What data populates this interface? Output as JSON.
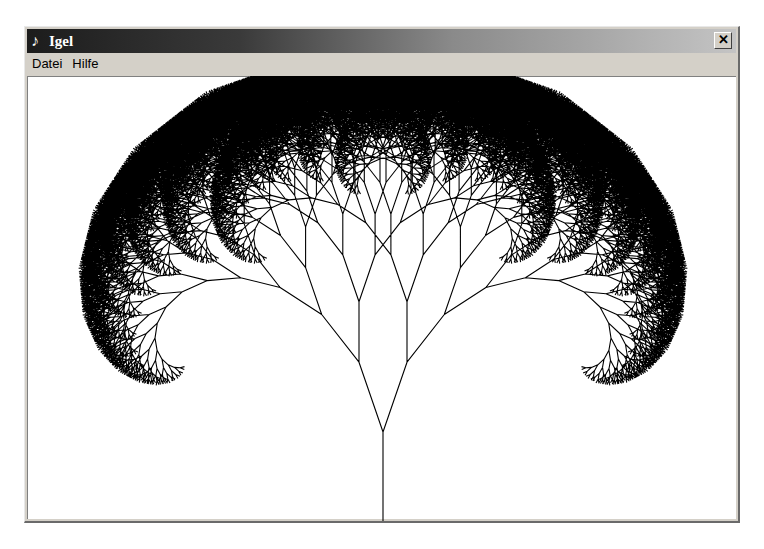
{
  "window": {
    "title": "Igel",
    "icon": "turtle-pen-icon",
    "icon_glyph": "♪",
    "close_glyph": "✕"
  },
  "menu": {
    "items": [
      {
        "label": "Datei"
      },
      {
        "label": "Hilfe"
      }
    ]
  },
  "drawing": {
    "type": "fractal-tree",
    "stroke_color": "#000000",
    "background_color": "#ffffff",
    "trunk_base": [
      383,
      522
    ],
    "trunk_length": 90,
    "branch_angle_deg": 19,
    "length_ratio": 0.82,
    "depth": 15
  }
}
